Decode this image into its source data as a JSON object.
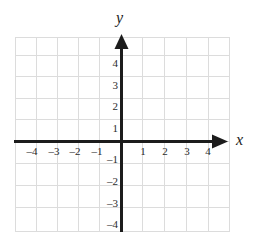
{
  "figure": {
    "kind": "cartesian-coordinate-plane",
    "axis_labels": {
      "x": "x",
      "y": "y"
    },
    "colors": {
      "grid": "#dcdcdc",
      "axis": "#1c1c1c",
      "tick_text": "#2b2b2b",
      "background": "#ffffff"
    },
    "geometry": {
      "origin_x": 121,
      "origin_y": 141,
      "cell_size": 21.5,
      "grid_left": 15,
      "grid_right": 230,
      "grid_top": 37,
      "grid_bottom": 232,
      "columns": 10,
      "rows": 9
    },
    "axes": {
      "x_axis": {
        "range_min": -5,
        "range_max": 5,
        "arrow": "right",
        "labeled_ticks": [
          -4,
          -3,
          -2,
          -1,
          1,
          2,
          3,
          4
        ]
      },
      "y_axis": {
        "range_min": -4,
        "range_max": 5,
        "arrow": "up",
        "labeled_ticks": [
          4,
          3,
          2,
          1,
          -1,
          -2,
          -3,
          -4
        ]
      }
    },
    "x_tick_labels": [
      {
        "value": -4,
        "text": "–4"
      },
      {
        "value": -3,
        "text": "–3"
      },
      {
        "value": -2,
        "text": "–2"
      },
      {
        "value": -1,
        "text": "–1"
      },
      {
        "value": 1,
        "text": "1"
      },
      {
        "value": 2,
        "text": "2"
      },
      {
        "value": 3,
        "text": "3"
      },
      {
        "value": 4,
        "text": "4"
      }
    ],
    "y_tick_labels": [
      {
        "value": 4,
        "text": "4"
      },
      {
        "value": 3,
        "text": "3"
      },
      {
        "value": 2,
        "text": "2"
      },
      {
        "value": 1,
        "text": "1"
      },
      {
        "value": -1,
        "text": "–1"
      },
      {
        "value": -2,
        "text": "–2"
      },
      {
        "value": -3,
        "text": "–3"
      },
      {
        "value": -4,
        "text": "–4"
      }
    ],
    "plotted_points": [],
    "plotted_curves": []
  }
}
